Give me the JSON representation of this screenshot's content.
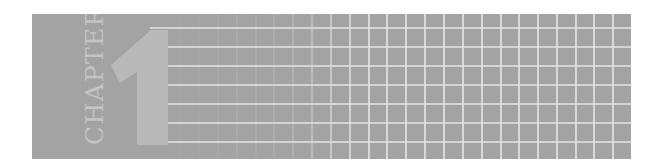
{
  "banner": {
    "label": "CHAPTER",
    "number": "1",
    "number_aria": "Chapter number 1",
    "colors": {
      "background": "#a3a3a3",
      "numeral": "#b9b9b9",
      "label": "#c4c4c4",
      "grid_line": "#e6e6e6"
    }
  }
}
